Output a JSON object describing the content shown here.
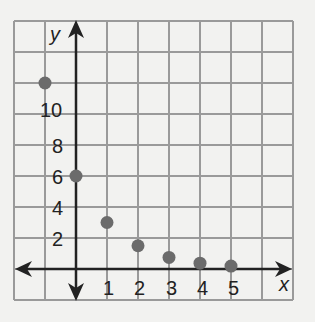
{
  "chart_data": {
    "type": "scatter",
    "title": "",
    "xlabel": "x",
    "ylabel": "y",
    "grid": true,
    "x_tick_labels": [
      "1",
      "2",
      "3",
      "4",
      "5"
    ],
    "y_tick_labels": [
      "2",
      "4",
      "6",
      "8",
      "10"
    ],
    "xlim": [
      -2,
      7
    ],
    "ylim": [
      -2,
      16
    ],
    "grid_step": {
      "x": 1,
      "y": 2
    },
    "series": [
      {
        "name": "points",
        "x": [
          -1,
          0,
          1,
          2,
          3,
          4,
          5
        ],
        "y": [
          12,
          6,
          3,
          1.5,
          0.75,
          0.375,
          0.19
        ]
      }
    ],
    "colors": {
      "grid": "#9a9a9a",
      "axis": "#222222",
      "point": "#6b6b6b",
      "background": "#f2f2f0"
    }
  },
  "labels": {
    "x_axis": "x",
    "y_axis": "y",
    "x_ticks": [
      "1",
      "2",
      "3",
      "4",
      "5"
    ],
    "y_ticks": [
      "2",
      "4",
      "6",
      "8",
      "10"
    ]
  }
}
